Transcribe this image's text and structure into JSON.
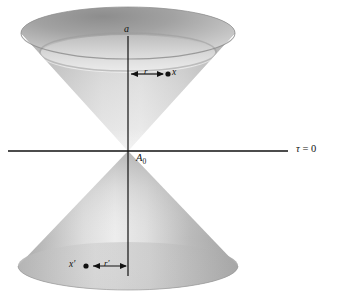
{
  "figure": {
    "kind": "light-cone-diagram",
    "background_color": "#ffffff",
    "ink_color": "#111111",
    "canvas": {
      "width": 340,
      "height": 300
    }
  },
  "axes": {
    "vertical": {
      "label": "a",
      "name": "vertical-axis",
      "x": 128,
      "y_top": 36,
      "y_bottom": 276
    },
    "horizontal": {
      "label_tau": "τ",
      "label_equals": " = ",
      "label_value": "0",
      "label_full": "τ = 0",
      "name": "horizontal-axis",
      "y": 151,
      "x_left": 8,
      "x_right": 288
    }
  },
  "origin": {
    "label": "A",
    "subscript": "0",
    "label_full": "A₀",
    "x": 128,
    "y": 151
  },
  "upper_cone": {
    "name": "future-light-cone",
    "rim_center_x": 128,
    "rim_center_y": 33,
    "rim_rx": 107,
    "rim_ry": 26,
    "inner_rim_center_y": 54,
    "inner_rim_rx": 88,
    "inner_rim_ry": 19,
    "outer_fill_top": "#aeaeae",
    "outer_fill_bottom": "#d8d8d8",
    "inner_fill_top": "#9d9d9d",
    "inner_fill_bottom": "#e6e6e6"
  },
  "lower_cone": {
    "name": "past-light-cone",
    "base_center_x": 128,
    "base_center_y": 266,
    "base_rx": 110,
    "base_ry": 24,
    "fill_left": "#b6b6b6",
    "fill_center": "#e2e2e2",
    "fill_right": "#a8a8a8"
  },
  "annotations": {
    "upper": {
      "name": "radius-annotation-upper",
      "segment_label": "r",
      "point_label": "x",
      "arrow_y": 74,
      "arrow_x_start": 130,
      "arrow_x_end": 165,
      "point_x": 168,
      "point_y": 74
    },
    "lower": {
      "name": "radius-annotation-lower",
      "segment_label": "r′",
      "point_label": "x′",
      "arrow_y": 266,
      "arrow_x_start": 92,
      "arrow_x_end": 127,
      "point_x": 86,
      "point_y": 266
    }
  }
}
